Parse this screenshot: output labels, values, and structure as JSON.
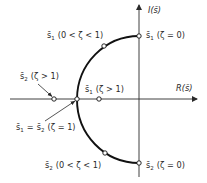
{
  "diagram": {
    "type": "root-locus-s-plane",
    "axes": {
      "real_label": "R(s̄)",
      "imag_label": "I(s̄)"
    },
    "points": [
      {
        "id": "s1-zeta0",
        "root": "s̄",
        "sub": "1",
        "condition": "(ζ = 0)"
      },
      {
        "id": "s1-under",
        "root": "s̄",
        "sub": "1",
        "condition": "(0 < ζ < 1)"
      },
      {
        "id": "s1-over",
        "root": "s̄",
        "sub": "1",
        "condition": "(ζ > 1)"
      },
      {
        "id": "s2-over",
        "root": "s̄",
        "sub": "2",
        "condition": "(ζ > 1)"
      },
      {
        "id": "s2-under",
        "root": "s̄",
        "sub": "2",
        "condition": "(0 < ζ < 1)"
      },
      {
        "id": "s2-zeta0",
        "root": "s̄",
        "sub": "2",
        "condition": "(ζ = 0)"
      }
    ],
    "double_root": {
      "lhs_root": "s̄",
      "lhs_sub": "1",
      "equals": "=",
      "rhs_root": "s̄",
      "rhs_sub": "2",
      "condition": "(ζ = 1)"
    }
  }
}
